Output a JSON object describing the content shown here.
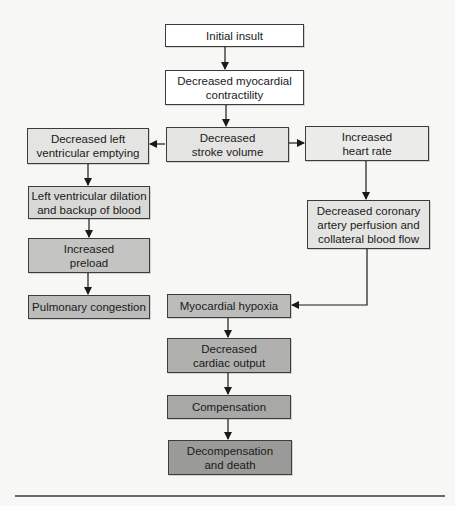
{
  "diagram": {
    "type": "flowchart",
    "colors": {
      "background": "#f7f7f5",
      "white": "#ffffff",
      "light_gray": "#e4e4e2",
      "lighter_gray": "#ebebea",
      "mid_gray": "#d2d2d0",
      "medium_gray": "#bcbcba",
      "dark_gray": "#acacaa",
      "darkest_gray": "#9a9a98",
      "border": "#3c3c3c",
      "arrow": "#1a1a1a"
    },
    "nodes": {
      "initial_insult": {
        "line1": "Initial insult"
      },
      "decreased_contractility": {
        "line1": "Decreased myocardial",
        "line2": "contractility"
      },
      "decreased_lv_emptying": {
        "line1": "Decreased left",
        "line2": "ventricular emptying"
      },
      "decreased_stroke_volume": {
        "line1": "Decreased",
        "line2": "stroke volume"
      },
      "increased_heart_rate": {
        "line1": "Increased",
        "line2": "heart rate"
      },
      "lv_dilation": {
        "line1": "Left ventricular dilation",
        "line2": "and backup of blood"
      },
      "increased_preload": {
        "line1": "Increased",
        "line2": "preload"
      },
      "decreased_coronary_perfusion": {
        "line1": "Decreased coronary",
        "line2": "artery perfusion and",
        "line3": "collateral blood flow"
      },
      "pulmonary_congestion": {
        "line1": "Pulmonary congestion"
      },
      "myocardial_hypoxia": {
        "line1": "Myocardial hypoxia"
      },
      "decreased_cardiac_output": {
        "line1": "Decreased",
        "line2": "cardiac output"
      },
      "compensation": {
        "line1": "Compensation"
      },
      "decompensation_death": {
        "line1": "Decompensation",
        "line2": "and death"
      }
    },
    "edges": [
      [
        "initial_insult",
        "decreased_contractility"
      ],
      [
        "decreased_contractility",
        "decreased_stroke_volume"
      ],
      [
        "decreased_stroke_volume",
        "decreased_lv_emptying"
      ],
      [
        "decreased_stroke_volume",
        "increased_heart_rate"
      ],
      [
        "decreased_lv_emptying",
        "lv_dilation"
      ],
      [
        "lv_dilation",
        "increased_preload"
      ],
      [
        "increased_preload",
        "pulmonary_congestion"
      ],
      [
        "increased_heart_rate",
        "decreased_coronary_perfusion"
      ],
      [
        "decreased_coronary_perfusion",
        "myocardial_hypoxia"
      ],
      [
        "myocardial_hypoxia",
        "decreased_cardiac_output"
      ],
      [
        "decreased_cardiac_output",
        "compensation"
      ],
      [
        "compensation",
        "decompensation_death"
      ]
    ]
  }
}
